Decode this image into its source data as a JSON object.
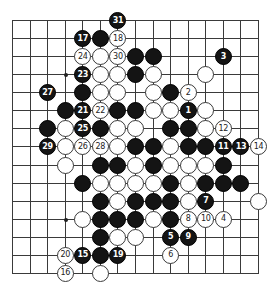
{
  "board": {
    "cols": 15,
    "rows": 15,
    "origin_x": 12,
    "origin_y": 20,
    "step_x": 17.57,
    "step_y": 18.07,
    "line_color": "#3a3a3a",
    "black_color": "#141414",
    "white_color": "#ffffff"
  },
  "star_points": [
    {
      "c": 3,
      "r": 3
    },
    {
      "c": 3,
      "r": 11
    }
  ],
  "stones": [
    {
      "c": 6,
      "r": 0,
      "color": "black",
      "label": "31"
    },
    {
      "c": 4,
      "r": 1,
      "color": "black",
      "label": "17"
    },
    {
      "c": 5,
      "r": 1,
      "color": "black",
      "label": ""
    },
    {
      "c": 6,
      "r": 1,
      "color": "white",
      "label": "18"
    },
    {
      "c": 4,
      "r": 2,
      "color": "white",
      "label": "24"
    },
    {
      "c": 5,
      "r": 2,
      "color": "white",
      "label": ""
    },
    {
      "c": 6,
      "r": 2,
      "color": "white",
      "label": "30"
    },
    {
      "c": 7,
      "r": 2,
      "color": "black",
      "label": ""
    },
    {
      "c": 8,
      "r": 2,
      "color": "black",
      "label": ""
    },
    {
      "c": 12,
      "r": 2,
      "color": "black",
      "label": "3"
    },
    {
      "c": 4,
      "r": 3,
      "color": "black",
      "label": "23"
    },
    {
      "c": 5,
      "r": 3,
      "color": "white",
      "label": ""
    },
    {
      "c": 6,
      "r": 3,
      "color": "white",
      "label": ""
    },
    {
      "c": 7,
      "r": 3,
      "color": "black",
      "label": ""
    },
    {
      "c": 8,
      "r": 3,
      "color": "white",
      "label": ""
    },
    {
      "c": 11,
      "r": 3,
      "color": "white",
      "label": ""
    },
    {
      "c": 2,
      "r": 4,
      "color": "black",
      "label": "27"
    },
    {
      "c": 4,
      "r": 4,
      "color": "black",
      "label": ""
    },
    {
      "c": 5,
      "r": 4,
      "color": "white",
      "label": ""
    },
    {
      "c": 6,
      "r": 4,
      "color": "white",
      "label": ""
    },
    {
      "c": 8,
      "r": 4,
      "color": "white",
      "label": ""
    },
    {
      "c": 9,
      "r": 4,
      "color": "black",
      "label": ""
    },
    {
      "c": 10,
      "r": 4,
      "color": "white",
      "label": "2"
    },
    {
      "c": 3,
      "r": 5,
      "color": "black",
      "label": ""
    },
    {
      "c": 4,
      "r": 5,
      "color": "black",
      "label": "21"
    },
    {
      "c": 5,
      "r": 5,
      "color": "white",
      "label": "22"
    },
    {
      "c": 6,
      "r": 5,
      "color": "black",
      "label": ""
    },
    {
      "c": 7,
      "r": 5,
      "color": "black",
      "label": ""
    },
    {
      "c": 8,
      "r": 5,
      "color": "white",
      "label": ""
    },
    {
      "c": 9,
      "r": 5,
      "color": "white",
      "label": ""
    },
    {
      "c": 10,
      "r": 5,
      "color": "black",
      "label": "1"
    },
    {
      "c": 11,
      "r": 5,
      "color": "white",
      "label": ""
    },
    {
      "c": 2,
      "r": 6,
      "color": "black",
      "label": ""
    },
    {
      "c": 3,
      "r": 6,
      "color": "white",
      "label": ""
    },
    {
      "c": 4,
      "r": 6,
      "color": "black",
      "label": "25"
    },
    {
      "c": 5,
      "r": 6,
      "color": "black",
      "label": ""
    },
    {
      "c": 6,
      "r": 6,
      "color": "white",
      "label": ""
    },
    {
      "c": 7,
      "r": 6,
      "color": "white",
      "label": ""
    },
    {
      "c": 9,
      "r": 6,
      "color": "black",
      "label": ""
    },
    {
      "c": 10,
      "r": 6,
      "color": "black",
      "label": ""
    },
    {
      "c": 11,
      "r": 6,
      "color": "white",
      "label": ""
    },
    {
      "c": 12,
      "r": 6,
      "color": "white",
      "label": "12"
    },
    {
      "c": 2,
      "r": 7,
      "color": "black",
      "label": "29"
    },
    {
      "c": 3,
      "r": 7,
      "color": "white",
      "label": ""
    },
    {
      "c": 4,
      "r": 7,
      "color": "white",
      "label": "26"
    },
    {
      "c": 5,
      "r": 7,
      "color": "white",
      "label": "28"
    },
    {
      "c": 6,
      "r": 7,
      "color": "white",
      "label": ""
    },
    {
      "c": 7,
      "r": 7,
      "color": "black",
      "label": ""
    },
    {
      "c": 8,
      "r": 7,
      "color": "black",
      "label": ""
    },
    {
      "c": 9,
      "r": 7,
      "color": "white",
      "label": ""
    },
    {
      "c": 10,
      "r": 7,
      "color": "black",
      "label": ""
    },
    {
      "c": 11,
      "r": 7,
      "color": "black",
      "label": ""
    },
    {
      "c": 12,
      "r": 7,
      "color": "black",
      "label": "11"
    },
    {
      "c": 13,
      "r": 7,
      "color": "black",
      "label": "13"
    },
    {
      "c": 14,
      "r": 7,
      "color": "white",
      "label": "14"
    },
    {
      "c": 3,
      "r": 8,
      "color": "white",
      "label": ""
    },
    {
      "c": 5,
      "r": 8,
      "color": "black",
      "label": ""
    },
    {
      "c": 6,
      "r": 8,
      "color": "black",
      "label": ""
    },
    {
      "c": 7,
      "r": 8,
      "color": "white",
      "label": ""
    },
    {
      "c": 8,
      "r": 8,
      "color": "black",
      "label": ""
    },
    {
      "c": 9,
      "r": 8,
      "color": "white",
      "label": ""
    },
    {
      "c": 10,
      "r": 8,
      "color": "white",
      "label": ""
    },
    {
      "c": 11,
      "r": 8,
      "color": "white",
      "label": ""
    },
    {
      "c": 12,
      "r": 8,
      "color": "black",
      "label": ""
    },
    {
      "c": 4,
      "r": 9,
      "color": "black",
      "label": ""
    },
    {
      "c": 5,
      "r": 9,
      "color": "white",
      "label": ""
    },
    {
      "c": 6,
      "r": 9,
      "color": "white",
      "label": ""
    },
    {
      "c": 7,
      "r": 9,
      "color": "white",
      "label": ""
    },
    {
      "c": 8,
      "r": 9,
      "color": "white",
      "label": ""
    },
    {
      "c": 9,
      "r": 9,
      "color": "black",
      "label": ""
    },
    {
      "c": 10,
      "r": 9,
      "color": "white",
      "label": ""
    },
    {
      "c": 11,
      "r": 9,
      "color": "black",
      "label": ""
    },
    {
      "c": 12,
      "r": 9,
      "color": "black",
      "label": ""
    },
    {
      "c": 13,
      "r": 9,
      "color": "black",
      "label": ""
    },
    {
      "c": 5,
      "r": 10,
      "color": "black",
      "label": ""
    },
    {
      "c": 6,
      "r": 10,
      "color": "white",
      "label": ""
    },
    {
      "c": 7,
      "r": 10,
      "color": "black",
      "label": ""
    },
    {
      "c": 8,
      "r": 10,
      "color": "black",
      "label": ""
    },
    {
      "c": 9,
      "r": 10,
      "color": "black",
      "label": ""
    },
    {
      "c": 10,
      "r": 10,
      "color": "white",
      "label": ""
    },
    {
      "c": 11,
      "r": 10,
      "color": "black",
      "label": "7"
    },
    {
      "c": 14,
      "r": 10,
      "color": "white",
      "label": ""
    },
    {
      "c": 4,
      "r": 11,
      "color": "white",
      "label": ""
    },
    {
      "c": 5,
      "r": 11,
      "color": "black",
      "label": ""
    },
    {
      "c": 6,
      "r": 11,
      "color": "black",
      "label": ""
    },
    {
      "c": 7,
      "r": 11,
      "color": "black",
      "label": ""
    },
    {
      "c": 8,
      "r": 11,
      "color": "white",
      "label": ""
    },
    {
      "c": 9,
      "r": 11,
      "color": "black",
      "label": ""
    },
    {
      "c": 10,
      "r": 11,
      "color": "white",
      "label": "8"
    },
    {
      "c": 11,
      "r": 11,
      "color": "white",
      "label": "10"
    },
    {
      "c": 12,
      "r": 11,
      "color": "white",
      "label": "4"
    },
    {
      "c": 5,
      "r": 12,
      "color": "black",
      "label": ""
    },
    {
      "c": 6,
      "r": 12,
      "color": "white",
      "label": ""
    },
    {
      "c": 7,
      "r": 12,
      "color": "white",
      "label": ""
    },
    {
      "c": 9,
      "r": 12,
      "color": "black",
      "label": "5"
    },
    {
      "c": 10,
      "r": 12,
      "color": "black",
      "label": "9"
    },
    {
      "c": 3,
      "r": 13,
      "color": "white",
      "label": "20"
    },
    {
      "c": 4,
      "r": 13,
      "color": "black",
      "label": "15"
    },
    {
      "c": 5,
      "r": 13,
      "color": "black",
      "label": ""
    },
    {
      "c": 6,
      "r": 13,
      "color": "black",
      "label": "19"
    },
    {
      "c": 9,
      "r": 13,
      "color": "white",
      "label": "6"
    },
    {
      "c": 3,
      "r": 14,
      "color": "white",
      "label": "16"
    },
    {
      "c": 5,
      "r": 14,
      "color": "white",
      "label": ""
    }
  ]
}
